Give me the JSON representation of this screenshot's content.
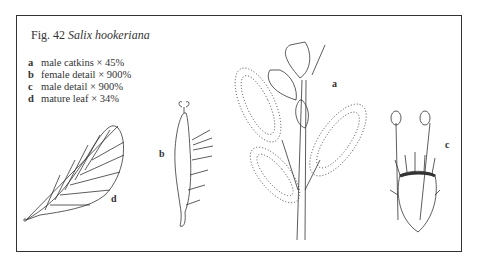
{
  "figure": {
    "number_label": "Fig. 42",
    "species": "Salix hookeriana",
    "legend": [
      {
        "key": "a",
        "text": "male catkins",
        "scale": "× 45%"
      },
      {
        "key": "b",
        "text": "female detail",
        "scale": "× 900%"
      },
      {
        "key": "c",
        "text": "male detail",
        "scale": "× 900%"
      },
      {
        "key": "d",
        "text": "mature leaf",
        "scale": "× 34%"
      }
    ],
    "panel_labels": {
      "a": "a",
      "b": "b",
      "c": "c",
      "d": "d"
    },
    "colors": {
      "ink": "#333333",
      "background": "#ffffff"
    }
  }
}
